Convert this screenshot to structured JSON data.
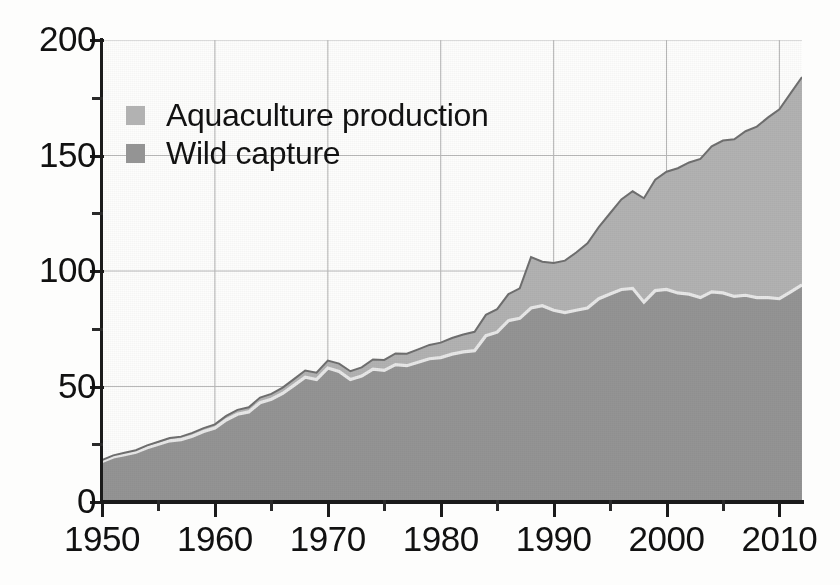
{
  "chart_data": {
    "type": "area",
    "stacked": true,
    "title": "",
    "subtitle": "",
    "xlabel": "",
    "ylabel": "",
    "xlim": [
      1950,
      2012
    ],
    "ylim": [
      0,
      200
    ],
    "xticks": [
      1950,
      1960,
      1970,
      1980,
      1990,
      2000,
      2010
    ],
    "xtick_labels": [
      "1950",
      "1960",
      "1970",
      "1980",
      "1990",
      "2000",
      "2010"
    ],
    "xticks_minor": [
      1955,
      1965,
      1975,
      1985,
      1995,
      2005
    ],
    "yticks": [
      0,
      50,
      100,
      150,
      200
    ],
    "ytick_labels": [
      "0",
      "50",
      "100",
      "150",
      "200"
    ],
    "yticks_minor": [
      25,
      75,
      125,
      175
    ],
    "grid": true,
    "grid_color": "#b9b9b9",
    "legend_position": "upper-left",
    "legend": [
      {
        "name": "Aquaculture production",
        "color": "#b2b2b2"
      },
      {
        "name": "Wild capture",
        "color": "#949494"
      }
    ],
    "x": [
      1950,
      1951,
      1952,
      1953,
      1954,
      1955,
      1956,
      1957,
      1958,
      1959,
      1960,
      1961,
      1962,
      1963,
      1964,
      1965,
      1966,
      1967,
      1968,
      1969,
      1970,
      1971,
      1972,
      1973,
      1974,
      1975,
      1976,
      1977,
      1978,
      1979,
      1980,
      1981,
      1982,
      1983,
      1984,
      1985,
      1986,
      1987,
      1988,
      1989,
      1990,
      1991,
      1992,
      1993,
      1994,
      1995,
      1996,
      1997,
      1998,
      1999,
      2000,
      2001,
      2002,
      2003,
      2004,
      2005,
      2006,
      2007,
      2008,
      2009,
      2010,
      2011,
      2012
    ],
    "series": [
      {
        "name": "Wild capture",
        "color": "#949494",
        "values": [
          17.5,
          19.5,
          20.5,
          21.5,
          23.5,
          25.0,
          26.5,
          27.0,
          28.5,
          30.5,
          32.0,
          35.5,
          38.0,
          39.0,
          43.0,
          44.5,
          47.0,
          50.5,
          54.0,
          53.0,
          58.0,
          56.5,
          53.0,
          54.5,
          57.5,
          57.0,
          59.5,
          59.0,
          60.5,
          62.0,
          62.5,
          64.0,
          65.0,
          65.5,
          72.0,
          73.5,
          78.5,
          79.5,
          84.0,
          85.0,
          83.0,
          82.0,
          83.0,
          84.0,
          88.0,
          90.0,
          92.0,
          92.5,
          86.5,
          91.5,
          92.0,
          90.5,
          90.0,
          88.5,
          91.0,
          90.5,
          89.0,
          89.5,
          88.5,
          88.5,
          88.0,
          91.0,
          94.0
        ]
      },
      {
        "name": "Aquaculture production",
        "color": "#b2b2b2",
        "values": [
          0.6,
          0.7,
          0.8,
          0.9,
          1.0,
          1.1,
          1.2,
          1.3,
          1.4,
          1.5,
          1.6,
          1.8,
          1.9,
          2.0,
          2.2,
          2.3,
          2.5,
          2.7,
          2.9,
          3.0,
          3.2,
          3.4,
          3.6,
          3.8,
          4.2,
          4.5,
          4.8,
          5.2,
          5.6,
          6.0,
          6.5,
          7.0,
          7.5,
          8.2,
          9.0,
          10.0,
          11.5,
          13.0,
          22.0,
          19.0,
          20.5,
          22.5,
          25.0,
          28.0,
          31.0,
          35.0,
          39.0,
          42.0,
          45.0,
          48.0,
          51.0,
          54.0,
          57.0,
          60.0,
          63.0,
          66.0,
          68.0,
          71.0,
          74.0,
          78.0,
          82.0,
          86.0,
          90.0
        ]
      }
    ],
    "totals": [
      18.1,
      20.2,
      21.3,
      22.4,
      24.5,
      26.1,
      27.7,
      28.3,
      29.9,
      32.0,
      33.6,
      37.3,
      39.9,
      41.0,
      45.2,
      46.8,
      49.5,
      53.2,
      56.9,
      56.0,
      61.2,
      59.9,
      56.6,
      58.3,
      61.7,
      61.5,
      64.3,
      64.2,
      66.1,
      68.0,
      69.0,
      71.0,
      72.5,
      73.7,
      81.0,
      83.5,
      90.0,
      92.5,
      106.0,
      104.0,
      103.5,
      104.5,
      108.0,
      112.0,
      119.0,
      125.0,
      131.0,
      134.5,
      131.5,
      139.5,
      143.0,
      144.5,
      147.0,
      148.5,
      154.0,
      156.5,
      157.0,
      160.5,
      162.5,
      166.5,
      170.0,
      177.0,
      184.0
    ]
  },
  "legend": {
    "items": [
      {
        "label": "Aquaculture production",
        "swatch": "legend-swatch-aquaculture"
      },
      {
        "label": "Wild capture",
        "swatch": "legend-swatch-wild-capture"
      }
    ]
  },
  "axes": {
    "y": {
      "labels": [
        "200",
        "150",
        "100",
        "50",
        "0"
      ]
    },
    "x": {
      "labels": [
        "1950",
        "1960",
        "1970",
        "1980",
        "1990",
        "2000",
        "2010"
      ]
    }
  },
  "colors": {
    "aquaculture": "#b2b2b2",
    "wild_capture": "#949494",
    "axis": "#1b1b1b",
    "grid": "#b9b9b9",
    "boundary": "#e8e8e8",
    "background": "#fdfdfc"
  }
}
